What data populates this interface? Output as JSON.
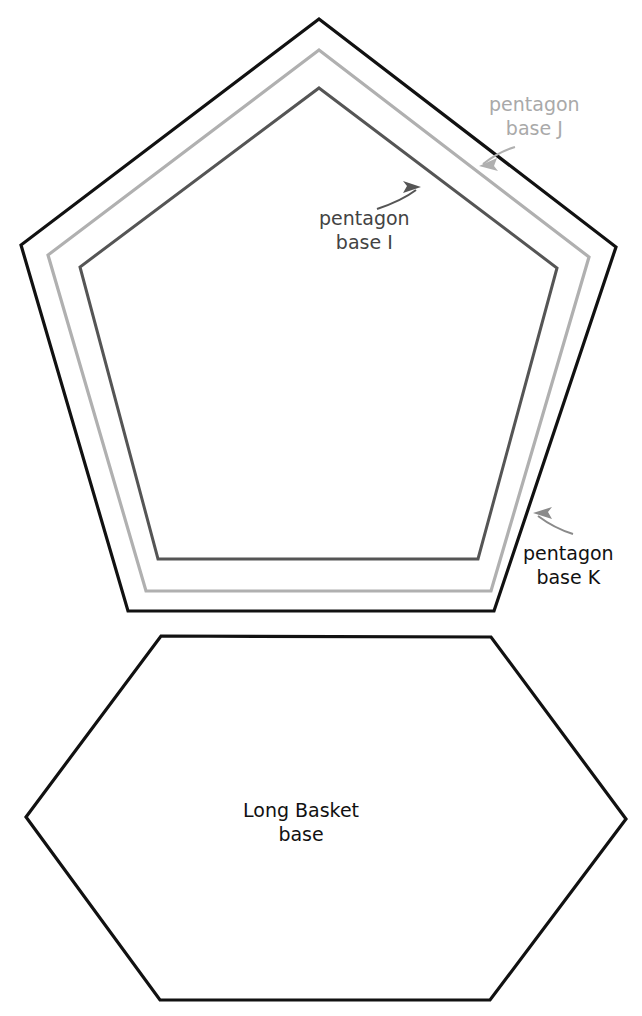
{
  "figure": {
    "background_color": "#ffffff",
    "width": 642,
    "height": 1016
  },
  "colors": {
    "outer_pentagon_stroke": "#111111",
    "middle_pentagon_stroke": "#b0b0b0",
    "inner_pentagon_stroke": "#555555",
    "hexagon_stroke": "#111111",
    "label_j_color": "#a9a9a9",
    "label_i_color": "#434343",
    "label_k_color": "#111111",
    "label_hex_color": "#111111",
    "arrow_j_color": "#b0b0b0",
    "arrow_i_color": "#555555",
    "arrow_k_color": "#8a8a8a"
  },
  "shapes": {
    "outer_pentagon": {
      "name": "pentagon base K",
      "points": "319,19 616,247 494,611 128,611 21,245",
      "stroke_width": 3.2
    },
    "middle_pentagon": {
      "name": "pentagon base J",
      "points": "319,50 589,257 491,591 146,591 48,255",
      "stroke_width": 3.2
    },
    "inner_pentagon": {
      "name": "pentagon base I",
      "points": "319,88 557,268 478,559 158,559 80,267",
      "stroke_width": 3.0
    },
    "hexagon": {
      "name": "Long Basket base",
      "points": "161,636 491,637 626,819 490,1000 160,1000 26,817",
      "stroke_width": 3.2
    }
  },
  "labels": {
    "pentagon_j": {
      "line1": "pentagon",
      "line2": "base J"
    },
    "pentagon_i": {
      "line1": "pentagon",
      "line2": "base I"
    },
    "pentagon_k": {
      "line1": "pentagon",
      "line2": "base K"
    },
    "long_basket": {
      "line1": "Long Basket",
      "line2": "base"
    }
  },
  "arrows": {
    "arrow_j": {
      "target": "pentagon base J",
      "path": "M 515,147 C 505,150 492,157 483,164",
      "tip": [
        479,
        166
      ],
      "direction": "left-down"
    },
    "arrow_i": {
      "target": "pentagon base I",
      "path": "M 377,209 C 392,204 408,196 416,190",
      "tip": [
        421,
        187
      ],
      "direction": "up-right"
    },
    "arrow_k": {
      "target": "pentagon base K",
      "path": "M 573,534 C 560,530 546,522 538,516",
      "tip": [
        533,
        513
      ],
      "direction": "up-left"
    }
  }
}
